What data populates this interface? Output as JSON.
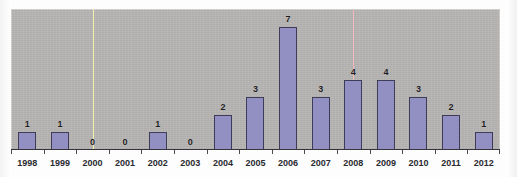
{
  "chart_data": {
    "type": "bar",
    "title": "",
    "subtitle": "",
    "xlabel": "",
    "ylabel": "",
    "categories": [
      "1998",
      "1999",
      "2000",
      "2001",
      "2002",
      "2003",
      "2004",
      "2005",
      "2006",
      "2007",
      "2008",
      "2009",
      "2010",
      "2011",
      "2012"
    ],
    "values": [
      1,
      1,
      0,
      0,
      1,
      0,
      2,
      3,
      7,
      3,
      4,
      4,
      3,
      2,
      1
    ],
    "value_labels": [
      "1",
      "1",
      "0",
      "0",
      "1",
      "0",
      "2",
      "3",
      "7",
      "3",
      "4",
      "4",
      "3",
      "2",
      "1"
    ],
    "ylim": [
      0,
      7
    ],
    "grid": false,
    "legend": "none",
    "bar_color": "#9290c2",
    "bar_border_color": "#3e3c58",
    "plot_background": "#b5b3b1",
    "label_color": "#1d1d23",
    "annotations": [
      {
        "name": "yellow-marker-line",
        "type": "vertical-line",
        "color": "#f2f0a8",
        "x_category": "2000"
      },
      {
        "name": "pink-marker-line",
        "type": "vertical-line",
        "color": "#f0b9bc",
        "x_category": "2008"
      }
    ]
  },
  "figure": {
    "name": "publications-per-year-bar-chart"
  }
}
